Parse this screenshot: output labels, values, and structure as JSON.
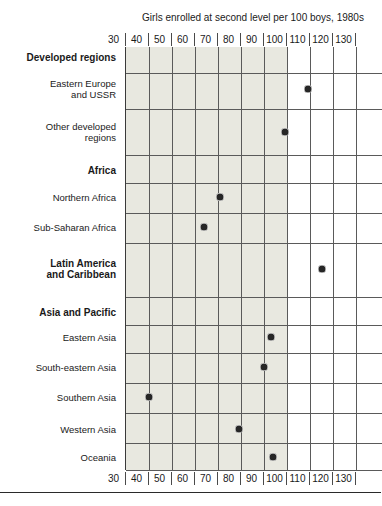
{
  "page": {
    "top_clipped_text": "",
    "bottom_rule": "divider"
  },
  "chart_data": {
    "type": "scatter",
    "title": "Girls enrolled at second level per 100 boys, 1980s",
    "xlabel": "",
    "ylabel": "",
    "xlim": [
      30,
      130
    ],
    "xticks": [
      30,
      40,
      50,
      60,
      70,
      80,
      90,
      100,
      110,
      120,
      130
    ],
    "xtick_labels": [
      "30",
      "40",
      "50",
      "60",
      "70",
      "80",
      "90",
      "100",
      "110",
      "120",
      "130"
    ],
    "grid": true,
    "legend": "none",
    "shaded_region": {
      "from": 30,
      "to": 100,
      "color": "#e8e8e0"
    },
    "marker_color": "#262626",
    "axis_color": "#5a5a5a",
    "categories": [
      "Eastern Europe and USSR",
      "Other developed regions",
      "Northern Africa",
      "Sub-Saharan Africa",
      "Latin America and Caribbean",
      "Eastern Asia",
      "South-eastern Asia",
      "Southern Asia",
      "Western Asia",
      "Oceania"
    ],
    "values": [
      109,
      99,
      71,
      64,
      115,
      93,
      90,
      40,
      79,
      94
    ],
    "groups": [
      "Developed regions",
      "Africa",
      "Latin America and Caribbean",
      "Asia and Pacific"
    ],
    "rows": [
      {
        "kind": "group",
        "label": "Developed regions",
        "value": null
      },
      {
        "kind": "item",
        "label": "Eastern Europe\nand USSR",
        "value": 109
      },
      {
        "kind": "item",
        "label": "Other developed\nregions",
        "value": 99
      },
      {
        "kind": "group",
        "label": "Africa",
        "value": null
      },
      {
        "kind": "item",
        "label": "Northern Africa",
        "value": 71
      },
      {
        "kind": "item",
        "label": "Sub-Saharan Africa",
        "value": 64
      },
      {
        "kind": "groupitem",
        "label": "Latin America\nand Caribbean",
        "value": 115
      },
      {
        "kind": "group",
        "label": "Asia and Pacific",
        "value": null
      },
      {
        "kind": "item",
        "label": "Eastern Asia",
        "value": 93
      },
      {
        "kind": "item",
        "label": "South-eastern Asia",
        "value": 90
      },
      {
        "kind": "item",
        "label": "Southern Asia",
        "value": 40
      },
      {
        "kind": "item",
        "label": "Western Asia",
        "value": 79
      },
      {
        "kind": "item",
        "label": "Oceania",
        "value": 94
      }
    ]
  },
  "labels": {
    "group_developed": "Developed regions",
    "item_eastern_europe_l1": "Eastern Europe",
    "item_eastern_europe_l2": "and USSR",
    "item_other_developed_l1": "Other developed",
    "item_other_developed_l2": "regions",
    "group_africa": "Africa",
    "item_northern_africa": "Northern Africa",
    "item_sub_saharan_africa": "Sub-Saharan Africa",
    "group_latin_america_l1": "Latin America",
    "group_latin_america_l2": "and Caribbean",
    "group_asia_pacific": "Asia and Pacific",
    "item_eastern_asia": "Eastern Asia",
    "item_south_eastern_asia": "South-eastern Asia",
    "item_southern_asia": "Southern Asia",
    "item_western_asia": "Western Asia",
    "item_oceania": "Oceania"
  }
}
